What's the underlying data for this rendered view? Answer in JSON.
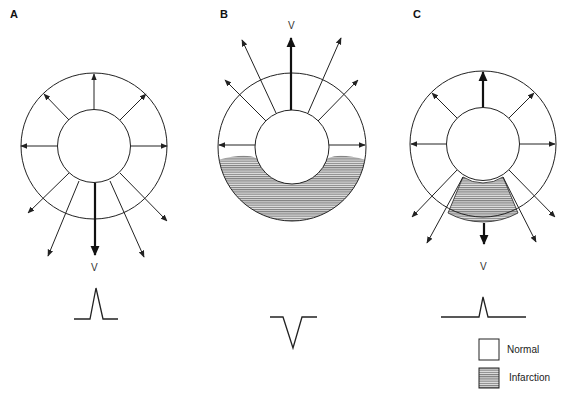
{
  "figure": {
    "panels": [
      {
        "id": "A",
        "label": "A",
        "vector_label": "V",
        "infarction": "none",
        "net_vector_direction": "down",
        "waveform": "upright"
      },
      {
        "id": "B",
        "label": "B",
        "vector_label": "V",
        "infarction": "transmural inferior (lower half of wall)",
        "net_vector_direction": "up",
        "waveform": "inverted"
      },
      {
        "id": "C",
        "label": "C",
        "vector_label": "V",
        "infarction": "inferior sector",
        "net_vector_direction": "down (reduced)",
        "waveform": "small upright"
      }
    ],
    "legend": {
      "items": [
        {
          "label": "Normal",
          "pattern": "blank"
        },
        {
          "label": "Infarction",
          "pattern": "horizontal-hatch"
        }
      ]
    },
    "colors": {
      "stroke": "#222222",
      "hatch": "#555555",
      "background": "#ffffff"
    }
  }
}
